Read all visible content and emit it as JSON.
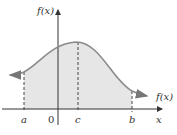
{
  "diagram": {
    "y_axis_label": "f(x)",
    "curve_label": "f(x)",
    "x_axis_label": "x",
    "origin_label": "0",
    "points": [
      {
        "name": "a",
        "label": "a"
      },
      {
        "name": "c",
        "label": "c"
      },
      {
        "name": "b",
        "label": "b"
      }
    ],
    "colors": {
      "curve": "#8a8a8a",
      "shading": "#e6e6e6",
      "axis": "#333333",
      "dashes": "#333333"
    }
  }
}
